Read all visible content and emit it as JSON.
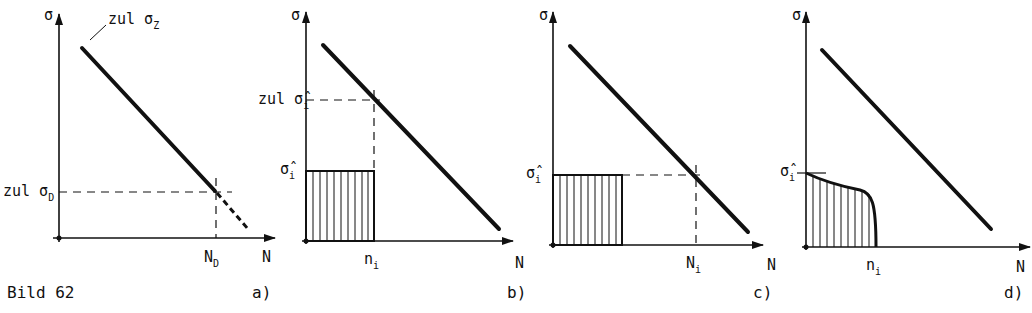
{
  "figure": {
    "caption": "Bild 62",
    "panels": [
      {
        "id": "a",
        "tag": "a)",
        "y_axis_label": "σ",
        "x_axis_label": "N",
        "line_label_prefix": "zul σ",
        "line_label_sub": "Z",
        "y_marker_prefix": "zul σ",
        "y_marker_sub": "D",
        "x_marker_main": "N",
        "x_marker_sub": "D"
      },
      {
        "id": "b",
        "tag": "b)",
        "y_axis_label": "σ",
        "x_axis_label": "N",
        "y_marker_upper_prefix": "zul σ̂",
        "y_marker_upper_sub": "i",
        "y_marker_lower_main": "σ̂",
        "y_marker_lower_sub": "i",
        "x_marker_main": "n",
        "x_marker_sub": "i"
      },
      {
        "id": "c",
        "tag": "c)",
        "y_axis_label": "σ",
        "x_axis_label": "N",
        "y_marker_main": "σ̂",
        "y_marker_sub": "i",
        "x_marker_main": "N",
        "x_marker_sub": "i"
      },
      {
        "id": "d",
        "tag": "d)",
        "y_axis_label": "σ",
        "x_axis_label": "N",
        "y_marker_main": "σ̂",
        "y_marker_sub": "i",
        "x_marker_main": "n",
        "x_marker_sub": "i"
      }
    ]
  }
}
